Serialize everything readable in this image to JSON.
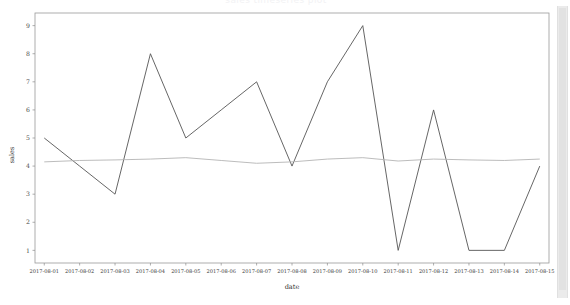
{
  "window": {
    "scrollbar_name": "vertical-scrollbar"
  },
  "chart_data": {
    "type": "line",
    "title": "sales timeseries plot",
    "xlabel": "date",
    "ylabel": "sales",
    "grid": false,
    "legend": "none",
    "ylim": [
      0.55,
      9.45
    ],
    "yticks": [
      1,
      2,
      3,
      4,
      5,
      6,
      7,
      8,
      9
    ],
    "categories": [
      "2017-08-01",
      "2017-08-02",
      "2017-08-03",
      "2017-08-04",
      "2017-08-05",
      "2017-08-06",
      "2017-08-07",
      "2017-08-08",
      "2017-08-09",
      "2017-08-10",
      "2017-08-11",
      "2017-08-12",
      "2017-08-13",
      "2017-08-14",
      "2017-08-15"
    ],
    "series": [
      {
        "name": "sales",
        "color": "#555555",
        "values": [
          5,
          4,
          3,
          8,
          5,
          6,
          7,
          4,
          7,
          9,
          1,
          6,
          1,
          1,
          4
        ]
      },
      {
        "name": "mean",
        "color": "#b4b4b4",
        "values": [
          4.15,
          4.2,
          4.22,
          4.25,
          4.3,
          4.2,
          4.1,
          4.15,
          4.25,
          4.3,
          4.18,
          4.25,
          4.22,
          4.2,
          4.25
        ]
      }
    ]
  }
}
